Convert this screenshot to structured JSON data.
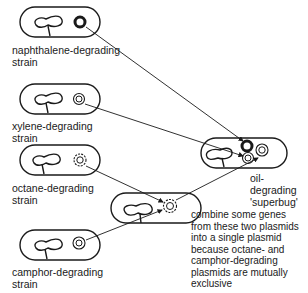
{
  "diagram": {
    "strains": [
      {
        "id": "naphthalene",
        "label": "naphthalene-degrading\nstrain",
        "plasmid": "solid-thick-ring"
      },
      {
        "id": "xylene",
        "label": "xylene-degrading\nstrain",
        "plasmid": "double-ring"
      },
      {
        "id": "octane",
        "label": "octane-degrading\nstrain",
        "plasmid": "beaded-ring"
      },
      {
        "id": "camphor",
        "label": "camphor-degrading\nstrain",
        "plasmid": "double-ring"
      }
    ],
    "result": {
      "label": "oil-degrading\n'superbug'"
    },
    "note": "combine some genes\nfrom these two plasmids\ninto a single plasmid\nbecause octane- and\ncamphor-degrading\nplasmids are mutually\nexclusive",
    "colors": {
      "line": "#1a1a1a",
      "background": "#ffffff"
    }
  }
}
